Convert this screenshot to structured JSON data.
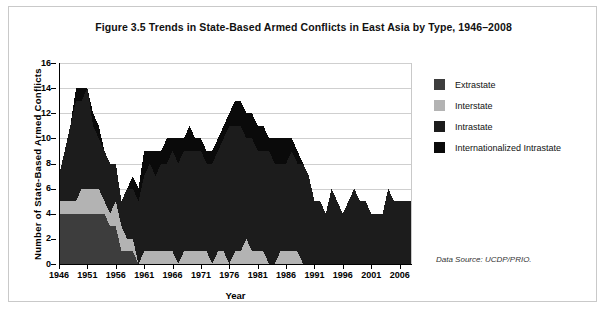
{
  "figure": {
    "title": "Figure 3.5 Trends in State-Based Armed Conflicts in East Asia by Type, 1946–2008",
    "data_source": "Data Source: UCDP/PRIO."
  },
  "legend": {
    "items": [
      {
        "label": "Extrastate",
        "color": "#3d3d3d"
      },
      {
        "label": "Interstate",
        "color": "#b3b3b3"
      },
      {
        "label": "Intrastate",
        "color": "#1c1c1c"
      },
      {
        "label": "Internationalized Intrastate",
        "color": "#0a0a0a"
      }
    ]
  },
  "chart_data": {
    "type": "area",
    "stacked": true,
    "title": "Figure 3.5 Trends in State-Based Armed Conflicts in East Asia by Type, 1946–2008",
    "xlabel": "Year",
    "ylabel": "Number of State-Based Armed Conflicts",
    "xlim": [
      1946,
      2008
    ],
    "ylim": [
      0,
      16
    ],
    "yticks": [
      0,
      2,
      4,
      6,
      8,
      10,
      12,
      14,
      16
    ],
    "xticks": [
      1946,
      1951,
      1956,
      1961,
      1966,
      1971,
      1976,
      1981,
      1986,
      1991,
      1996,
      2001,
      2006
    ],
    "grid": "horizontal",
    "legend_position": "right",
    "x": [
      1946,
      1947,
      1948,
      1949,
      1950,
      1951,
      1952,
      1953,
      1954,
      1955,
      1956,
      1957,
      1958,
      1959,
      1960,
      1961,
      1962,
      1963,
      1964,
      1965,
      1966,
      1967,
      1968,
      1969,
      1970,
      1971,
      1972,
      1973,
      1974,
      1975,
      1976,
      1977,
      1978,
      1979,
      1980,
      1981,
      1982,
      1983,
      1984,
      1985,
      1986,
      1987,
      1988,
      1989,
      1990,
      1991,
      1992,
      1993,
      1994,
      1995,
      1996,
      1997,
      1998,
      1999,
      2000,
      2001,
      2002,
      2003,
      2004,
      2005,
      2006,
      2007,
      2008
    ],
    "series": [
      {
        "name": "Extrastate",
        "color": "#3d3d3d",
        "values": [
          4,
          4,
          4,
          4,
          4,
          4,
          4,
          4,
          4,
          3,
          3,
          1,
          1,
          1,
          0,
          0,
          0,
          0,
          0,
          0,
          0,
          0,
          0,
          0,
          0,
          0,
          0,
          0,
          0,
          0,
          0,
          0,
          0,
          0,
          0,
          0,
          0,
          0,
          0,
          0,
          0,
          0,
          0,
          0,
          0,
          0,
          0,
          0,
          0,
          0,
          0,
          0,
          0,
          0,
          0,
          0,
          0,
          0,
          0,
          0,
          0,
          0,
          0
        ]
      },
      {
        "name": "Interstate",
        "color": "#b3b3b3",
        "values": [
          1,
          1,
          1,
          1,
          2,
          2,
          2,
          2,
          1,
          1,
          2,
          2,
          1,
          1,
          0,
          1,
          1,
          1,
          1,
          1,
          1,
          0,
          1,
          1,
          1,
          1,
          1,
          0,
          1,
          1,
          0,
          1,
          1,
          2,
          1,
          1,
          1,
          0,
          0,
          1,
          1,
          1,
          1,
          0,
          0,
          0,
          0,
          0,
          0,
          0,
          0,
          0,
          0,
          0,
          0,
          0,
          0,
          0,
          0,
          0,
          0,
          0,
          0
        ]
      },
      {
        "name": "Intrastate",
        "color": "#1c1c1c",
        "values": [
          2,
          4,
          6,
          8,
          7,
          8,
          5,
          4,
          4,
          4,
          3,
          2,
          4,
          4,
          5,
          6,
          7,
          6,
          7,
          7,
          8,
          8,
          8,
          8,
          8,
          8,
          7,
          8,
          8,
          9,
          11,
          10,
          10,
          8,
          9,
          8,
          8,
          9,
          8,
          7,
          7,
          8,
          7,
          8,
          7,
          5,
          5,
          4,
          6,
          5,
          4,
          5,
          6,
          5,
          5,
          4,
          4,
          4,
          6,
          5,
          5,
          5,
          5
        ]
      },
      {
        "name": "Internationalized Intrastate",
        "color": "#0a0a0a",
        "values": [
          0,
          0,
          0,
          1,
          1,
          0,
          1,
          1,
          0,
          0,
          0,
          0,
          0,
          1,
          1,
          2,
          1,
          2,
          1,
          2,
          1,
          2,
          1,
          2,
          1,
          1,
          1,
          1,
          1,
          1,
          1,
          2,
          2,
          2,
          2,
          2,
          2,
          1,
          2,
          2,
          2,
          1,
          1,
          0,
          0,
          0,
          0,
          0,
          0,
          0,
          0,
          0,
          0,
          0,
          0,
          0,
          0,
          0,
          0,
          0,
          0,
          0,
          0
        ]
      }
    ]
  }
}
